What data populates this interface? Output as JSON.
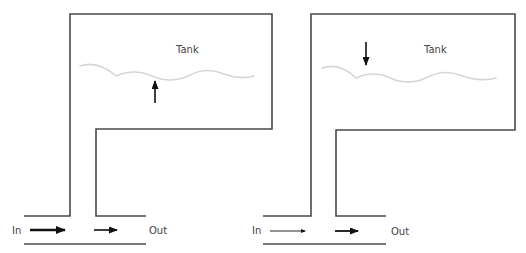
{
  "diagram": {
    "panels": [
      {
        "name": "filling",
        "tank_label": "Tank",
        "in_label": "In",
        "out_label": "Out",
        "inflow_arrow": "thick",
        "outflow_arrow": "medium",
        "level_arrow": "up"
      },
      {
        "name": "draining",
        "tank_label": "Tank",
        "in_label": "In",
        "out_label": "Out",
        "inflow_arrow": "thin",
        "outflow_arrow": "medium",
        "level_arrow": "down"
      }
    ],
    "colors": {
      "wall": "#4a4a4a",
      "arrow": "#111111",
      "water_surface": "#d6d6d6",
      "text": "#444444"
    }
  }
}
